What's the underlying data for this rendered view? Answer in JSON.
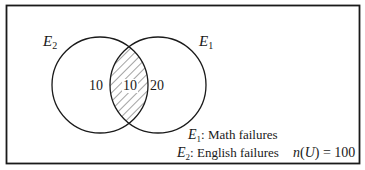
{
  "diagram": {
    "type": "venn",
    "universe": {
      "label": "n(U) = 100",
      "n_prefix": "n",
      "u_symbol": "U",
      "equals_value": "= 100",
      "total": 100
    },
    "sets": [
      {
        "id": "E1",
        "symbol": "E",
        "subscript": "1",
        "description": "Math failures"
      },
      {
        "id": "E2",
        "symbol": "E",
        "subscript": "2",
        "description": "English failures"
      }
    ],
    "regions": {
      "e2_only": "10",
      "intersection": "10",
      "e1_only": "20"
    },
    "shaded_region": "E1 ∩ E2",
    "legend": [
      {
        "symbol": "E",
        "subscript": "1",
        "separator": ":",
        "text": "Math failures"
      },
      {
        "symbol": "E",
        "subscript": "2",
        "separator": ":",
        "text": "English failures"
      }
    ],
    "colors": {
      "stroke": "#1a1a1a",
      "hatch": "#333333",
      "background": "#ffffff"
    }
  }
}
